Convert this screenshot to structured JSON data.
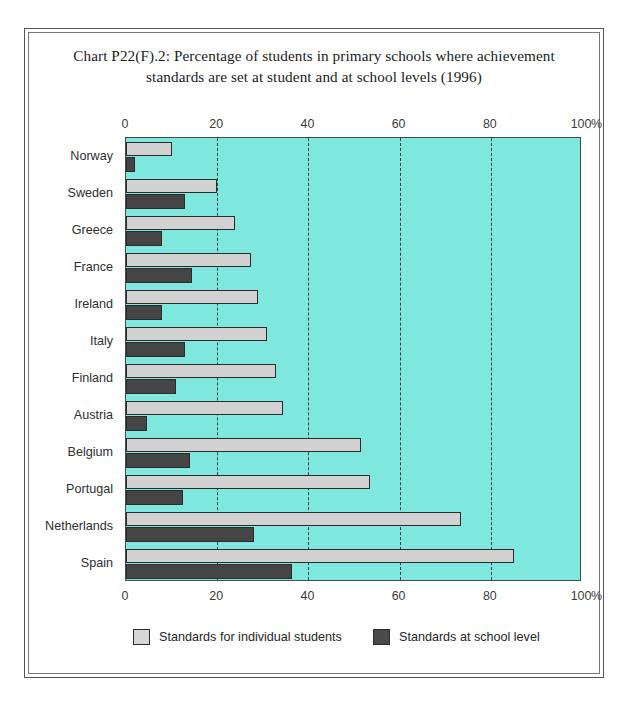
{
  "chart_data": {
    "type": "bar",
    "orientation": "horizontal",
    "title": "Chart P22(F).2: Percentage of students in primary schools where achievement standards are set at student and at school levels (1996)",
    "title_line1": "Chart P22(F).2: Percentage of students in primary schools where achievement",
    "title_line2": "standards are set at student and at school levels (1996)",
    "xlabel": "%",
    "ylabel": "",
    "xlim": [
      0,
      100
    ],
    "xticks": [
      0,
      20,
      40,
      60,
      80,
      100
    ],
    "xtick_labels": [
      "0",
      "20",
      "40",
      "60",
      "80",
      "100"
    ],
    "percent_sign": "%",
    "grid": "vertical-dashed-at-20-40-60-80",
    "gridlines_at": [
      20,
      40,
      60,
      80
    ],
    "axis_positions": [
      "top",
      "bottom"
    ],
    "legend_position": "bottom-center",
    "categories": [
      "Norway",
      "Sweden",
      "Greece",
      "France",
      "Ireland",
      "Italy",
      "Finland",
      "Austria",
      "Belgium",
      "Portugal",
      "Netherlands",
      "Spain"
    ],
    "series": [
      {
        "name": "Standards for individual students",
        "color": "#d2d2d2",
        "values": [
          10,
          20,
          24,
          27.5,
          29,
          31,
          33,
          34.5,
          51.5,
          53.5,
          73.5,
          85
        ]
      },
      {
        "name": "Standards at school level",
        "color": "#454545",
        "values": [
          2,
          13,
          8,
          14.5,
          8,
          13,
          11,
          4.5,
          14,
          12.5,
          28,
          36.5
        ]
      }
    ],
    "plot_background_color": "#7fe8de"
  },
  "legend": {
    "entries": [
      {
        "label": "Standards for individual students",
        "swatch": "light"
      },
      {
        "label": "Standards at school level",
        "swatch": "dark"
      }
    ]
  }
}
